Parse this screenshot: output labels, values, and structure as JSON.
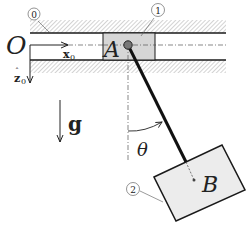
{
  "labels": {
    "origin": "O",
    "x_axis": "x",
    "x_axis_sub": "0",
    "z_axis": "z",
    "z_axis_sub": "0",
    "gravity": "g",
    "point_A": "A",
    "point_B": "B",
    "angle": "θ",
    "body_0": "0",
    "body_1": "1",
    "body_2": "2"
  },
  "colors": {
    "line": "#1a1a1a",
    "slider_fill": "#d6d6d6",
    "box_fill": "#ececec",
    "hatch": "#9a9a9a",
    "rod": "#111111"
  }
}
